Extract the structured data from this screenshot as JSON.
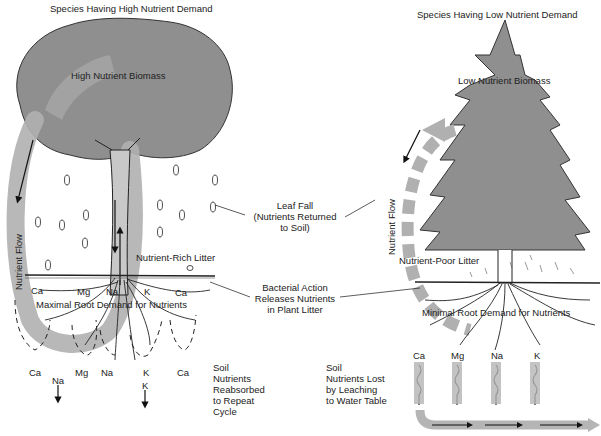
{
  "left_panel": {
    "title": "Species Having High Nutrient Demand",
    "canopy_label": "High Nutrient Biomass",
    "flow_label": "Nutrient Flow",
    "litter_label": "Nutrient-Rich Litter",
    "root_label": "Maximal Root Demand for Nutrients",
    "soil_ions_top": [
      "Ca",
      "Mg",
      "Na",
      "K",
      "Ca"
    ],
    "soil_ions_bottom": [
      "Ca",
      "Mg",
      "Na",
      "K",
      "Ca"
    ],
    "leached_ions": [
      "Na",
      "K"
    ],
    "soil_note": [
      "Soil",
      "Nutrients",
      "Reabsorbed",
      "to Repeat",
      "Cycle"
    ]
  },
  "right_panel": {
    "title": "Species Having Low Nutrient Demand",
    "canopy_label": "Low Nutrient Biomass",
    "flow_label": "Nutrient Flow",
    "litter_label": "Nutrient-Poor Litter",
    "root_label": "Minimal Root Demand for Nutrients",
    "leached_ions": [
      "Ca",
      "Mg",
      "Na",
      "K"
    ],
    "soil_note": [
      "Soil",
      "Nutrients Lost",
      "by Leaching",
      "to Water Table"
    ]
  },
  "center_callouts": {
    "leaf_fall": [
      "Leaf Fall",
      "(Nutrients Returned",
      "to Soil)"
    ],
    "bacterial": [
      "Bacterial Action",
      "Releases Nutrients",
      "in Plant Litter"
    ]
  },
  "colors": {
    "canopy": "#8f8f8f",
    "flow_band": "#b5b5b5",
    "outline": "#222222",
    "background": "#ffffff"
  }
}
